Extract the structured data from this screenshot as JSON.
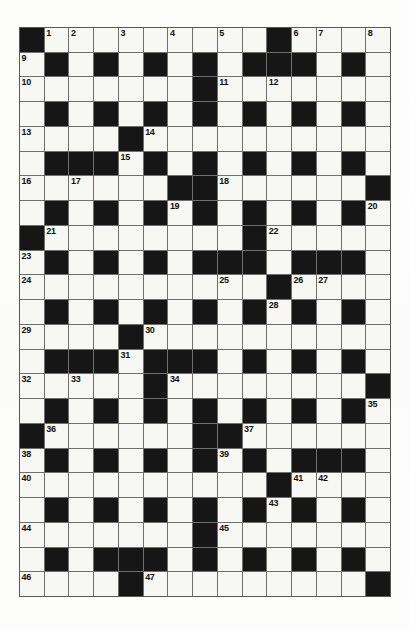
{
  "puzzle": {
    "title": "Crossword Grid",
    "type": "crossword-grid",
    "rows": 23,
    "cols": 15,
    "colors": {
      "block": "#161616",
      "open": "#f7f7f4",
      "gridline": "#6f6f6f",
      "number": "#101010",
      "paper": "#fdfdfc"
    },
    "legend": {
      "block_symbol": "#",
      "open_symbol": ".",
      "description": "# = blocked (black) square, . = open (white) square"
    },
    "layout": [
      "#..............",
      ".#.#.#.#.###.#.",
      ".......#.......",
      ".#.#.#.#.#.#.#.",
      "....#..........",
      ".###.#.#.#.#.#.",
      "......##.....#",
      ".#.#.#.#.#.#.#.",
      "#........#.....",
      ".#.#.#.###.###.",
      "..........#....",
      ".#.#.#.#.#.#.#.",
      "....#..........",
      ".###.###.#.#.#.",
      "......D.......#",
      ".#.#.#.#.#.#.#.",
      "#......##......",
      ".#.#.#.#.#.###.",
      "..........#....",
      ".#.#.#.#.#.#.#.",
      ".......#.......",
      ".#.###.#.#.#.#.",
      "....#.........#"
    ],
    "grid": [
      [
        "#",
        "1",
        "2",
        "",
        "3",
        "",
        "4",
        "",
        "5",
        "",
        "#",
        "6",
        "7",
        "",
        "8"
      ],
      [
        "9",
        "#",
        "",
        "#",
        "",
        "#",
        "",
        "#",
        "",
        "#",
        "#",
        "#",
        "",
        "#",
        ""
      ],
      [
        "10",
        "",
        "",
        "",
        "",
        "",
        "",
        "#",
        "11",
        "",
        "12",
        "",
        "",
        "",
        ""
      ],
      [
        "",
        "#",
        "",
        "#",
        "",
        "#",
        "",
        "#",
        "",
        "#",
        "",
        "#",
        "",
        "#",
        ""
      ],
      [
        "13",
        "",
        "",
        "",
        "#",
        "14",
        "",
        "",
        "",
        "",
        "",
        "",
        "",
        "",
        ""
      ],
      [
        "",
        "#",
        "#",
        "#",
        "15",
        "#",
        "",
        "#",
        "",
        "#",
        "",
        "#",
        "",
        "#",
        ""
      ],
      [
        "16",
        "",
        "17",
        "",
        "",
        "",
        "#",
        "#",
        "18",
        "",
        "",
        "",
        "",
        "",
        "#"
      ],
      [
        "",
        "#",
        "",
        "#",
        "",
        "#",
        "19",
        "#",
        "",
        "#",
        "",
        "#",
        "",
        "#",
        "20"
      ],
      [
        "#",
        "21",
        "",
        "",
        "",
        "",
        "",
        "",
        "",
        "#",
        "22",
        "",
        "",
        "",
        ""
      ],
      [
        "23",
        "#",
        "",
        "#",
        "",
        "#",
        "",
        "#",
        "#",
        "#",
        "",
        "#",
        "#",
        "#",
        ""
      ],
      [
        "24",
        "",
        "",
        "",
        "",
        "",
        "",
        "",
        "25",
        "",
        "#",
        "26",
        "27",
        "",
        ""
      ],
      [
        "",
        "#",
        "",
        "#",
        "",
        "#",
        "",
        "#",
        "",
        "#",
        "28",
        "#",
        "",
        "#",
        ""
      ],
      [
        "29",
        "",
        "",
        "",
        "#",
        "30",
        "",
        "",
        "",
        "",
        "",
        "",
        "",
        "",
        ""
      ],
      [
        "",
        "#",
        "#",
        "#",
        "31",
        "#",
        "#",
        "#",
        "",
        "#",
        "",
        "#",
        "",
        "#",
        ""
      ],
      [
        "32",
        "",
        "33",
        "",
        "",
        "#",
        "34",
        "",
        "",
        "",
        "",
        "",
        "",
        "",
        "#"
      ],
      [
        "",
        "#",
        "",
        "#",
        "",
        "#",
        "",
        "#",
        "",
        "#",
        "",
        "#",
        "",
        "#",
        "35"
      ],
      [
        "#",
        "36",
        "",
        "",
        "",
        "",
        "",
        "#",
        "#",
        "37",
        "",
        "",
        "",
        "",
        ""
      ],
      [
        "38",
        "#",
        "",
        "#",
        "",
        "#",
        "",
        "#",
        "39",
        "#",
        "",
        "#",
        "#",
        "#",
        ""
      ],
      [
        "40",
        "",
        "",
        "",
        "",
        "",
        "",
        "",
        "",
        "",
        "#",
        "41",
        "42",
        "",
        ""
      ],
      [
        "",
        "#",
        "",
        "#",
        "",
        "#",
        "",
        "#",
        "",
        "#",
        "43",
        "#",
        "",
        "#",
        ""
      ],
      [
        "44",
        "",
        "",
        "",
        "",
        "",
        "",
        "#",
        "45",
        "",
        "",
        "",
        "",
        "",
        ""
      ],
      [
        "",
        "#",
        "",
        "#",
        "#",
        "#",
        "",
        "#",
        "",
        "#",
        "",
        "#",
        "",
        "#",
        ""
      ],
      [
        "46",
        "",
        "",
        "",
        "#",
        "47",
        "",
        "",
        "",
        "",
        "",
        "",
        "",
        "",
        "#"
      ]
    ],
    "blocks": [
      [
        0,
        0
      ],
      [
        0,
        10
      ],
      [
        1,
        1
      ],
      [
        1,
        3
      ],
      [
        1,
        5
      ],
      [
        1,
        7
      ],
      [
        1,
        9
      ],
      [
        1,
        10
      ],
      [
        1,
        11
      ],
      [
        1,
        13
      ],
      [
        2,
        7
      ],
      [
        3,
        1
      ],
      [
        3,
        3
      ],
      [
        3,
        5
      ],
      [
        3,
        7
      ],
      [
        3,
        9
      ],
      [
        3,
        11
      ],
      [
        3,
        13
      ],
      [
        4,
        4
      ],
      [
        5,
        1
      ],
      [
        5,
        2
      ],
      [
        5,
        3
      ],
      [
        5,
        5
      ],
      [
        5,
        7
      ],
      [
        5,
        9
      ],
      [
        5,
        11
      ],
      [
        5,
        13
      ],
      [
        6,
        6
      ],
      [
        6,
        7
      ],
      [
        6,
        14
      ],
      [
        7,
        1
      ],
      [
        7,
        3
      ],
      [
        7,
        5
      ],
      [
        7,
        7
      ],
      [
        7,
        9
      ],
      [
        7,
        11
      ],
      [
        7,
        13
      ],
      [
        8,
        0
      ],
      [
        8,
        9
      ],
      [
        9,
        1
      ],
      [
        9,
        3
      ],
      [
        9,
        5
      ],
      [
        9,
        7
      ],
      [
        9,
        8
      ],
      [
        9,
        9
      ],
      [
        9,
        11
      ],
      [
        9,
        12
      ],
      [
        9,
        13
      ],
      [
        10,
        10
      ],
      [
        11,
        1
      ],
      [
        11,
        3
      ],
      [
        11,
        5
      ],
      [
        11,
        7
      ],
      [
        11,
        9
      ],
      [
        11,
        11
      ],
      [
        11,
        13
      ],
      [
        12,
        4
      ],
      [
        13,
        1
      ],
      [
        13,
        2
      ],
      [
        13,
        3
      ],
      [
        13,
        5
      ],
      [
        13,
        6
      ],
      [
        13,
        7
      ],
      [
        13,
        9
      ],
      [
        13,
        11
      ],
      [
        13,
        13
      ],
      [
        14,
        5
      ],
      [
        14,
        14
      ],
      [
        15,
        1
      ],
      [
        15,
        3
      ],
      [
        15,
        5
      ],
      [
        15,
        7
      ],
      [
        15,
        9
      ],
      [
        15,
        11
      ],
      [
        15,
        13
      ],
      [
        16,
        0
      ],
      [
        16,
        7
      ],
      [
        16,
        8
      ],
      [
        17,
        1
      ],
      [
        17,
        3
      ],
      [
        17,
        5
      ],
      [
        17,
        7
      ],
      [
        17,
        9
      ],
      [
        17,
        11
      ],
      [
        17,
        12
      ],
      [
        17,
        13
      ],
      [
        18,
        10
      ],
      [
        19,
        1
      ],
      [
        19,
        3
      ],
      [
        19,
        5
      ],
      [
        19,
        7
      ],
      [
        19,
        9
      ],
      [
        19,
        11
      ],
      [
        19,
        13
      ],
      [
        20,
        7
      ],
      [
        21,
        1
      ],
      [
        21,
        3
      ],
      [
        21,
        4
      ],
      [
        21,
        5
      ],
      [
        21,
        7
      ],
      [
        21,
        9
      ],
      [
        21,
        11
      ],
      [
        21,
        13
      ],
      [
        22,
        4
      ],
      [
        22,
        14
      ]
    ],
    "numbers": [
      {
        "n": "1",
        "row": 0,
        "col": 1
      },
      {
        "n": "2",
        "row": 0,
        "col": 2
      },
      {
        "n": "3",
        "row": 0,
        "col": 4
      },
      {
        "n": "4",
        "row": 0,
        "col": 6
      },
      {
        "n": "5",
        "row": 0,
        "col": 8
      },
      {
        "n": "6",
        "row": 0,
        "col": 11
      },
      {
        "n": "7",
        "row": 0,
        "col": 12
      },
      {
        "n": "8",
        "row": 0,
        "col": 14
      },
      {
        "n": "9",
        "row": 1,
        "col": 0
      },
      {
        "n": "10",
        "row": 2,
        "col": 0
      },
      {
        "n": "11",
        "row": 2,
        "col": 8
      },
      {
        "n": "12",
        "row": 2,
        "col": 10
      },
      {
        "n": "13",
        "row": 4,
        "col": 0
      },
      {
        "n": "14",
        "row": 4,
        "col": 5
      },
      {
        "n": "15",
        "row": 5,
        "col": 4
      },
      {
        "n": "16",
        "row": 6,
        "col": 0
      },
      {
        "n": "17",
        "row": 6,
        "col": 2
      },
      {
        "n": "18",
        "row": 6,
        "col": 8
      },
      {
        "n": "19",
        "row": 7,
        "col": 6
      },
      {
        "n": "20",
        "row": 7,
        "col": 14
      },
      {
        "n": "21",
        "row": 8,
        "col": 1
      },
      {
        "n": "22",
        "row": 8,
        "col": 10
      },
      {
        "n": "23",
        "row": 9,
        "col": 0
      },
      {
        "n": "24",
        "row": 10,
        "col": 0
      },
      {
        "n": "25",
        "row": 10,
        "col": 8
      },
      {
        "n": "26",
        "row": 10,
        "col": 11
      },
      {
        "n": "27",
        "row": 10,
        "col": 12
      },
      {
        "n": "28",
        "row": 11,
        "col": 10
      },
      {
        "n": "29",
        "row": 12,
        "col": 0
      },
      {
        "n": "30",
        "row": 12,
        "col": 5
      },
      {
        "n": "31",
        "row": 13,
        "col": 4
      },
      {
        "n": "32",
        "row": 14,
        "col": 0
      },
      {
        "n": "33",
        "row": 14,
        "col": 2
      },
      {
        "n": "34",
        "row": 14,
        "col": 6
      },
      {
        "n": "35",
        "row": 15,
        "col": 14
      },
      {
        "n": "36",
        "row": 16,
        "col": 1
      },
      {
        "n": "37",
        "row": 16,
        "col": 9
      },
      {
        "n": "38",
        "row": 17,
        "col": 0
      },
      {
        "n": "39",
        "row": 17,
        "col": 8
      },
      {
        "n": "40",
        "row": 18,
        "col": 0
      },
      {
        "n": "41",
        "row": 18,
        "col": 11
      },
      {
        "n": "42",
        "row": 18,
        "col": 12
      },
      {
        "n": "43",
        "row": 19,
        "col": 10
      },
      {
        "n": "44",
        "row": 20,
        "col": 0
      },
      {
        "n": "45",
        "row": 20,
        "col": 8
      },
      {
        "n": "46",
        "row": 22,
        "col": 0
      },
      {
        "n": "47",
        "row": 22,
        "col": 5
      }
    ]
  }
}
